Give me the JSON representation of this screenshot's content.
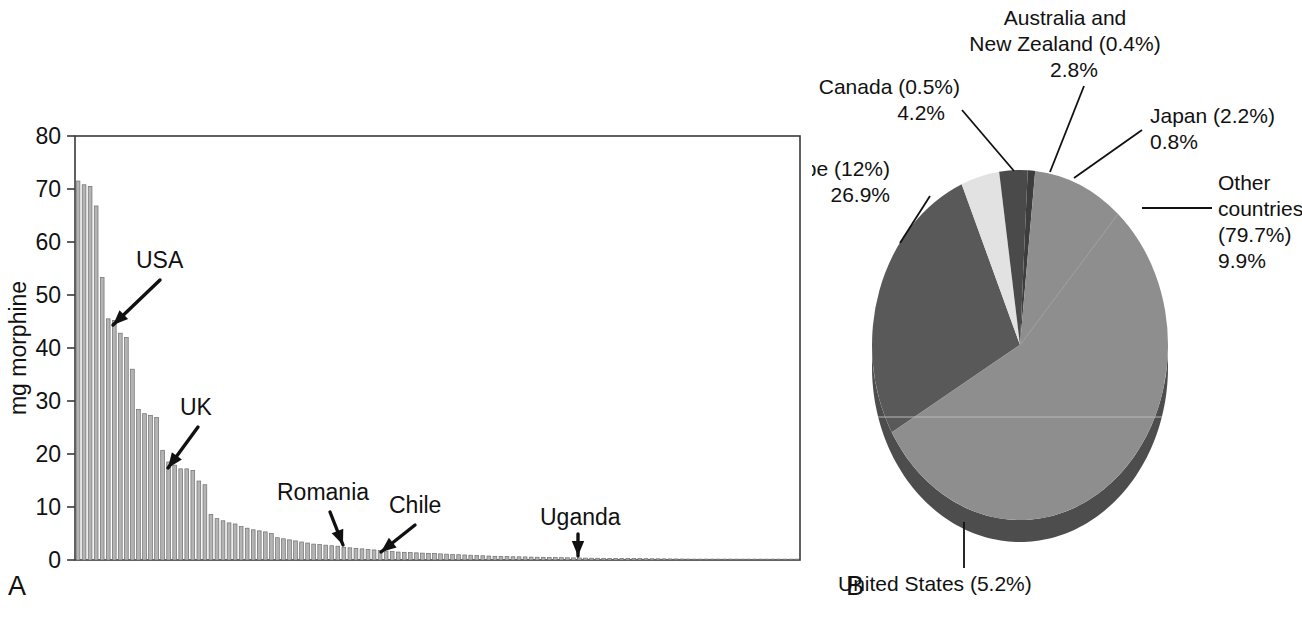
{
  "figure": {
    "panel_a_letter": "A",
    "panel_b_letter": "B"
  },
  "chart_data": [
    {
      "id": "panel_a",
      "type": "bar",
      "title": "",
      "xlabel": "",
      "ylabel": "mg morphine",
      "ylim": [
        0,
        80
      ],
      "yticks": [
        0,
        10,
        20,
        30,
        40,
        50,
        60,
        70,
        80
      ],
      "ytick_labels": [
        "0",
        "10",
        "20",
        "30",
        "40",
        "50",
        "60",
        "70",
        "80"
      ],
      "grid": false,
      "bar_color": "#b4b4b4",
      "bar_edge_color": "#6e6e6e",
      "categories_note": "Countries ranked by morphine consumption, descending",
      "values": [
        71.5,
        70.8,
        70.5,
        66.8,
        53.3,
        45.5,
        45.2,
        42.8,
        42.0,
        36.0,
        28.4,
        27.6,
        27.3,
        26.9,
        20.7,
        18.5,
        17.9,
        17.2,
        17.2,
        16.9,
        14.9,
        14.2,
        8.6,
        7.8,
        7.4,
        7.0,
        6.8,
        6.3,
        6.0,
        5.7,
        5.5,
        5.3,
        5.0,
        4.2,
        4.0,
        3.8,
        3.6,
        3.4,
        3.2,
        3.0,
        2.9,
        2.8,
        2.7,
        2.6,
        2.4,
        2.3,
        2.2,
        2.1,
        2.0,
        1.9,
        1.8,
        1.7,
        1.6,
        1.5,
        1.45,
        1.4,
        1.35,
        1.3,
        1.25,
        1.2,
        1.15,
        1.1,
        1.05,
        1.0,
        0.95,
        0.9,
        0.85,
        0.8,
        0.75,
        0.7,
        0.68,
        0.65,
        0.62,
        0.6,
        0.58,
        0.55,
        0.52,
        0.5,
        0.48,
        0.46,
        0.44,
        0.42,
        0.4,
        0.38,
        0.36,
        0.34,
        0.33,
        0.32,
        0.31,
        0.3,
        0.29,
        0.28,
        0.27,
        0.26,
        0.25,
        0.24,
        0.23,
        0.22,
        0.21,
        0.2,
        0.19,
        0.18,
        0.17,
        0.16,
        0.15,
        0.14,
        0.13,
        0.12,
        0.11,
        0.1,
        0.09,
        0.08,
        0.07,
        0.06,
        0.05,
        0.04,
        0.03,
        0.02,
        0.02,
        0.02
      ],
      "annotations": [
        {
          "label": "USA",
          "bar_index": 5
        },
        {
          "label": "UK",
          "bar_index": 15
        },
        {
          "label": "Romania",
          "bar_index": 34
        },
        {
          "label": "Chile",
          "bar_index": 47
        },
        {
          "label": "Uganda",
          "bar_index": 88
        }
      ]
    },
    {
      "id": "panel_b",
      "type": "pie",
      "title": "",
      "legend_position": "callout-labels",
      "slices": [
        {
          "name": "Europe",
          "population_share": "12%",
          "value": 26.9,
          "value_label": "26.9%",
          "color": "#595959"
        },
        {
          "name": "Canada",
          "population_share": "0.5%",
          "value": 4.2,
          "value_label": "4.2%",
          "color": "#e2e2e2"
        },
        {
          "name": "Australia and New Zealand",
          "population_share": "0.4%",
          "value": 2.8,
          "value_label": "2.8%",
          "color": "#4a4a4a"
        },
        {
          "name": "Japan",
          "population_share": "2.2%",
          "value": 0.8,
          "value_label": "0.8%",
          "color": "#3d3d3d"
        },
        {
          "name": "Other countries",
          "population_share": "79.7%",
          "value": 9.9,
          "value_label": "9.9%",
          "color": "#8e8e8e"
        },
        {
          "name": "United States",
          "population_share": "5.2%",
          "value": 55.4,
          "value_label": "55.4%",
          "color": "#8e8e8e"
        }
      ],
      "labels": {
        "europe_l1": "Europe (12%)",
        "europe_l2": "26.9%",
        "canada_l1": "Canada (0.5%)",
        "canada_l2": "4.2%",
        "anz_l1": "Australia and",
        "anz_l2": "New Zealand (0.4%)",
        "anz_l3": "2.8%",
        "japan_l1": "Japan (2.2%)",
        "japan_l2": "0.8%",
        "other_l1": "Other",
        "other_l2": "countries",
        "other_l3": "(79.7%)",
        "other_l4": "9.9%",
        "us_l1": "United States (5.2%)",
        "us_l2": "55.4%"
      }
    }
  ]
}
